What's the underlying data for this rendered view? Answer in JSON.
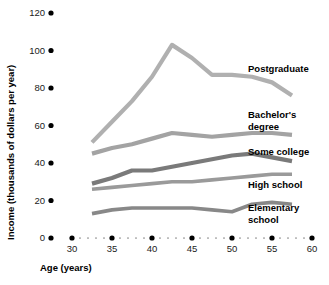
{
  "chart_data": {
    "type": "line",
    "title": "",
    "xlabel": "Age (years)",
    "ylabel": "Income (thousands of dollars per year)",
    "xlim": [
      28.5,
      61
    ],
    "ylim": [
      0,
      120
    ],
    "xticks": [
      30,
      35,
      40,
      45,
      50,
      55,
      60
    ],
    "yticks": [
      0,
      20,
      40,
      60,
      80,
      100,
      120
    ],
    "grid": false,
    "legend_position": "right-inline-labels",
    "x": [
      32.5,
      35,
      37.5,
      40,
      42.5,
      45,
      47.5,
      50,
      52.5,
      55,
      57.5
    ],
    "series": [
      {
        "name": "Postgraduate",
        "color": "#b0b0b0",
        "values": [
          51,
          62,
          73,
          86,
          103,
          96,
          87,
          87,
          86,
          83,
          76
        ]
      },
      {
        "name": "Bachelor's degree",
        "color": "#a3a3a3",
        "values": [
          45,
          48,
          50,
          53,
          56,
          55,
          54,
          55,
          56,
          56,
          55
        ]
      },
      {
        "name": "Some college",
        "color": "#7a7a7a",
        "values": [
          29,
          32,
          36,
          36,
          38,
          40,
          42,
          44,
          45,
          43,
          41
        ]
      },
      {
        "name": "High school",
        "color": "#9a9a9a",
        "values": [
          26,
          27,
          28,
          29,
          30,
          30,
          31,
          32,
          33,
          34,
          34
        ]
      },
      {
        "name": "Elementary school",
        "color": "#888888",
        "values": [
          13,
          15,
          16,
          16,
          16,
          16,
          15,
          14,
          18,
          19,
          18
        ]
      }
    ]
  },
  "axes": {
    "y_title": "Income (thousands of dollars per year)",
    "x_title": "Age (years)",
    "y_tick_labels": [
      "120",
      "100",
      "80",
      "60",
      "40",
      "20",
      "0"
    ],
    "x_tick_labels": [
      "30",
      "35",
      "40",
      "45",
      "50",
      "55",
      "60"
    ]
  },
  "series_labels": [
    {
      "text": "Postgraduate",
      "line1": "Postgraduate",
      "line2": ""
    },
    {
      "text": "Bachelor's degree",
      "line1": "Bachelor's",
      "line2": "degree"
    },
    {
      "text": "Some college",
      "line1": "Some college",
      "line2": ""
    },
    {
      "text": "High school",
      "line1": "High school",
      "line2": ""
    },
    {
      "text": "Elementary school",
      "line1": "Elementary",
      "line2": "school"
    }
  ],
  "colors": {
    "postgraduate": "#b0b0b0",
    "bachelors": "#a3a3a3",
    "some_college": "#7a7a7a",
    "high_school": "#9a9a9a",
    "elementary": "#888888",
    "axis": "#000000",
    "minor_dot": "#8a8a8a"
  }
}
